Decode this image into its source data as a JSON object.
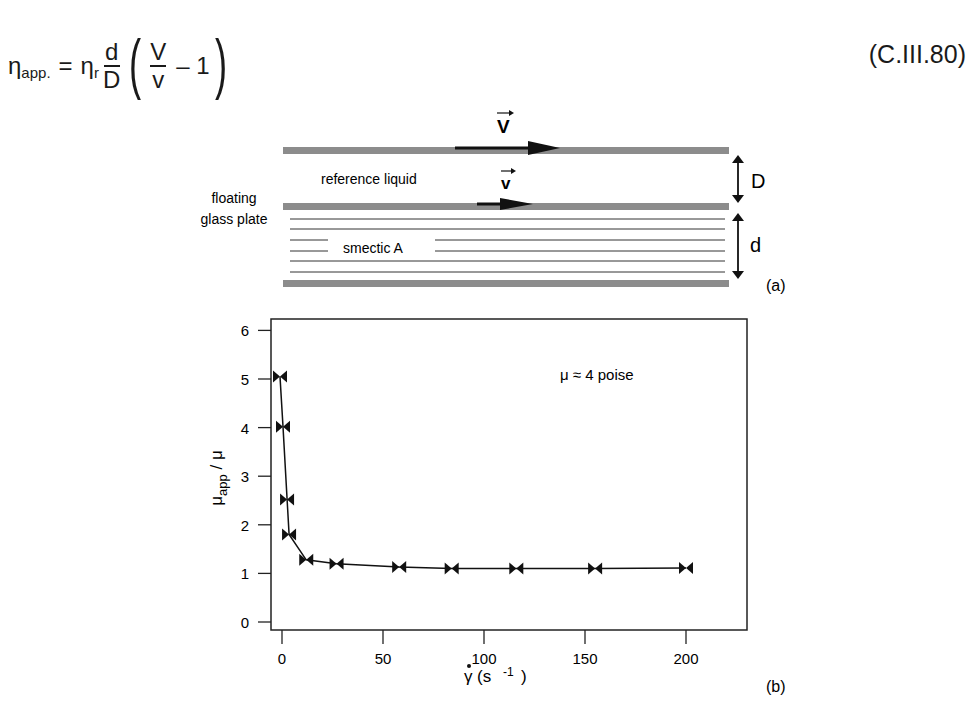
{
  "equation": {
    "lhs_symbol": "η",
    "lhs_sub": "app.",
    "equals": "=",
    "eta_r_symbol": "η",
    "eta_r_sub": "r",
    "frac1_num": "d",
    "frac1_den": "D",
    "frac2_num": "V",
    "frac2_den": "v",
    "minus_one": "– 1",
    "number": "(C.III.80)"
  },
  "diagram_a": {
    "velocity_top": "V",
    "velocity_bottom": "v",
    "reference_liquid": "reference liquid",
    "floating_plate_line1": "floating",
    "floating_plate_line2": "glass plate",
    "smectic": "smectic A",
    "gap_D": "D",
    "gap_d": "d",
    "panel_tag": "(a)",
    "plate_color": "#8c8c8c",
    "arrow_color": "#111111"
  },
  "chart_data": {
    "type": "line",
    "title": "",
    "annotation": "μ ≈ 4 poise",
    "xlabel": "γ̇ (s -1 )",
    "ylabel": "μapp / μ",
    "xlim": [
      -5,
      215
    ],
    "ylim": [
      0,
      6
    ],
    "x_ticks": [
      0,
      50,
      100,
      150,
      200
    ],
    "y_ticks": [
      0,
      1,
      2,
      3,
      4,
      5,
      6
    ],
    "grid": false,
    "legend": null,
    "marker": "bowtie",
    "series": [
      {
        "name": "μapp/μ",
        "x": [
          -1,
          0.5,
          2.5,
          3.5,
          12,
          27,
          58,
          84,
          116,
          155,
          200
        ],
        "y": [
          5.05,
          4.02,
          2.52,
          1.8,
          1.28,
          1.2,
          1.13,
          1.1,
          1.1,
          1.1,
          1.11
        ]
      }
    ],
    "panel_tag": "(b)"
  }
}
